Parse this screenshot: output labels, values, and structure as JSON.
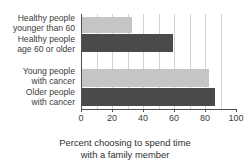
{
  "chart_data": {
    "type": "bar",
    "orientation": "horizontal",
    "title": "",
    "subtitle": "",
    "categories": [
      "Healthy people younger than 60",
      "Healthy people age 60 or older",
      "Young people with cancer",
      "Older people with cancer"
    ],
    "values": [
      32,
      59,
      82,
      86
    ],
    "xlabel": "Percent choosing to spend time with a family member",
    "ylabel": "",
    "xlim": [
      0,
      100
    ],
    "xticks": [
      0,
      20,
      40,
      60,
      80,
      100
    ],
    "minor_tick_step": 10,
    "grid": "vertical",
    "legend": "none",
    "bar_colors": [
      "#c5c5c5",
      "#4a4a4a",
      "#c5c5c5",
      "#4a4a4a"
    ]
  },
  "title": {
    "text": ""
  },
  "categories": [
    {
      "line1": "Healthy people",
      "line2": "younger than 60"
    },
    {
      "line1": "Healthy people",
      "line2": "age 60 or older"
    },
    {
      "line1": "Young people",
      "line2": "with cancer"
    },
    {
      "line1": "Older people",
      "line2": "with cancer"
    }
  ],
  "axis": {
    "tick_labels": [
      "0",
      "20",
      "40",
      "60",
      "80",
      "100"
    ],
    "title_line1": "Percent choosing to spend time",
    "title_line2": "with a family member"
  },
  "colors": {
    "light_bar": "#c5c5c5",
    "dark_bar": "#4a4a4a",
    "axis": "#4f4f4f",
    "gridline": "#d2d2d2",
    "text": "#3c3c3c",
    "background": "#ffffff"
  }
}
